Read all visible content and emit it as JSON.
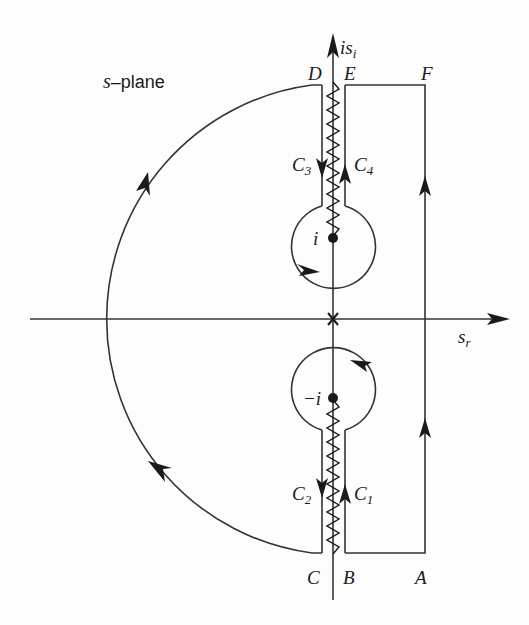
{
  "figure": {
    "plane_label": {
      "var": "s",
      "text": "–plane"
    },
    "axes": {
      "imag_axis": {
        "base": "is",
        "sub": "i"
      },
      "real_axis": {
        "base": "s",
        "sub": "r"
      }
    },
    "points": {
      "A": "A",
      "B": "B",
      "C": "C",
      "D": "D",
      "E": "E",
      "F": "F"
    },
    "poles": {
      "upper": "i",
      "lower": "−i"
    },
    "contours": [
      {
        "base": "C",
        "sub": "1"
      },
      {
        "base": "C",
        "sub": "2"
      },
      {
        "base": "C",
        "sub": "3"
      },
      {
        "base": "C",
        "sub": "4"
      }
    ],
    "colors": {
      "ink": "#1a1a1a",
      "background": "#fdfdfd"
    }
  }
}
